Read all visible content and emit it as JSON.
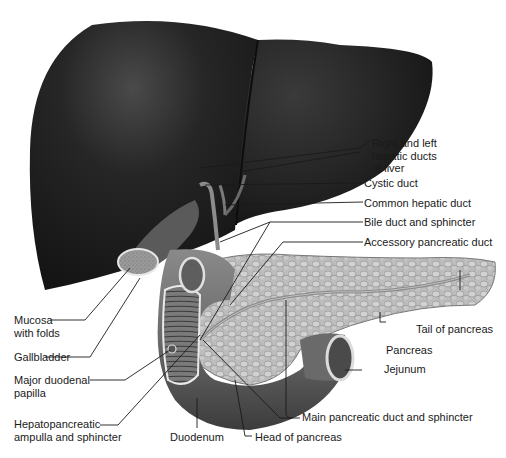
{
  "diagram": {
    "colors": {
      "liver": "#1f1f1f",
      "liver_highlight": "#555555",
      "duodenum": "#6e6e6e",
      "pancreas": "#b8b8b8",
      "leader_line": "#1a1a1a",
      "text": "#1a1a1a",
      "background": "#ffffff"
    },
    "labels": {
      "right_left_hepatic": "Right and left\nhepatic ducts\nof liver",
      "cystic_duct": "Cystic duct",
      "common_hepatic_duct": "Common hepatic duct",
      "bile_duct": "Bile duct and sphincter",
      "accessory_pancreatic_duct": "Accessory pancreatic duct",
      "mucosa": "Mucosa\nwith folds",
      "gallbladder": "Gallbladder",
      "major_duodenal_papilla": "Major duodenal\npapilla",
      "hepatopancreatic_ampulla": "Hepatopancreatic\nampulla and sphincter",
      "tail_of_pancreas": "Tail of pancreas",
      "pancreas": "Pancreas",
      "jejunum": "Jejunum",
      "main_pancreatic_duct": "Main pancreatic duct and sphincter",
      "duodenum": "Duodenum",
      "head_of_pancreas": "Head of pancreas"
    }
  }
}
